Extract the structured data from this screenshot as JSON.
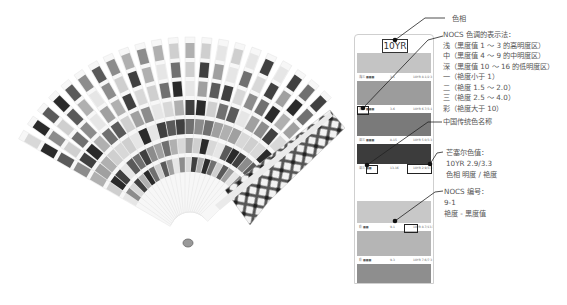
{
  "card": {
    "hue_label": "10YR",
    "rows": [
      {
        "band_color": "#c4c4c4",
        "label_left": "浅三 ■■■",
        "label_mid": "3-1",
        "label_right": "10YR 8.1/2.3"
      },
      {
        "band_color": "#9c9c9c",
        "label_left": "浅三 ■■■",
        "label_mid": "3-6",
        "label_right": "10YR 6.7/3.1"
      },
      {
        "band_color": "#7a7a7a",
        "label_left": "深三 ■■■",
        "label_mid": "8-15",
        "label_right": "10YR 5.0/3.3"
      },
      {
        "band_color": "#3c3c3c",
        "label_left": "深三 ■■",
        "label_mid": "13-16",
        "label_right": "10YR 2.9/3.3"
      },
      {
        "band_color": "#ffffff",
        "label_left": "",
        "label_mid": "",
        "label_right": ""
      },
      {
        "band_color": "#c8c8c8",
        "label_left": "彩 ■■",
        "label_mid": "9-1",
        "label_right": "10YR 8.7/13.3"
      },
      {
        "band_color": "#b5b5b5",
        "label_left": "彩 ■■■",
        "label_mid": "9-3",
        "label_right": "10YR 7.6/7.3"
      },
      {
        "band_color": "#8e8e8e",
        "label_left": "",
        "label_mid": "",
        "label_right": ""
      }
    ]
  },
  "annotations": {
    "hue": "色相",
    "nocs_title": "NOCS 色调的表示法：",
    "nocs_lines": [
      "浅（黑度值 1 ～ 3 的高明度区）",
      "中（黑度值 4 ～ 9 的中明度区）",
      "深（黑度值 10 ～ 16 的低明度区）",
      "一（艳度小于 1）",
      "二（艳度 1.5 ～ 2.0）",
      "三（艳度 2.5 ～ 4.0）",
      "彩（艳度大于 10）"
    ],
    "traditional_name": "中国传统色名称",
    "munsell_title": "芒塞尔色值：",
    "munsell_value": "10YR 2.9/3.3",
    "munsell_desc": "色相  明度 / 艳度",
    "nocs_code_title": "NOCS 编号：",
    "nocs_code_value": "9-1",
    "nocs_code_desc": "艳度 - 黑度值"
  },
  "colors": {
    "line": "#222222",
    "border": "#cfcfcf",
    "text": "#555555"
  }
}
